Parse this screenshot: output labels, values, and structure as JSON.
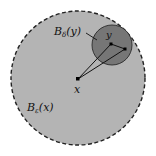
{
  "diagram": {
    "colors": {
      "background": "#ffffff",
      "outer_ball_fill": "#b4b4b4",
      "outer_ball_stroke": "#222222",
      "inner_ball_fill": "#767676",
      "inner_ball_stroke": "#2a2a2a",
      "line": "#111111"
    },
    "outer_ball": {
      "label_main": "B",
      "label_sub": "ε",
      "label_arg": "(x)"
    },
    "inner_ball": {
      "label_main": "B",
      "label_sub": "δ",
      "label_arg": "(y)"
    },
    "points": {
      "center_x": {
        "label": "x"
      },
      "center_y": {
        "label": "y"
      },
      "point_z": {
        "label": ""
      }
    }
  }
}
